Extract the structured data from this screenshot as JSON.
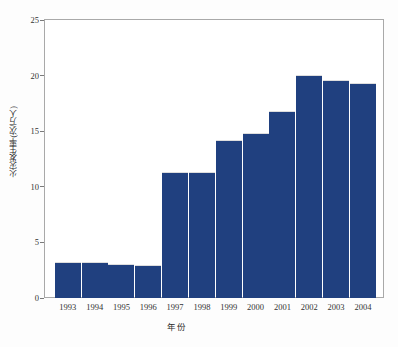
{
  "chart_data": {
    "type": "bar",
    "title": "",
    "subtitle": "",
    "xlabel": "年份",
    "ylabel": "火灾发生率(次/万人)",
    "categories": [
      "1993",
      "1994",
      "1995",
      "1996",
      "1997",
      "1998",
      "1999",
      "2000",
      "2001",
      "2002",
      "2003",
      "2004"
    ],
    "values": [
      3.2,
      3.25,
      3.1,
      3.0,
      11.3,
      11.3,
      14.25,
      14.8,
      16.8,
      20.05,
      19.6,
      19.3
    ],
    "series": [
      {
        "name": "火灾发生率",
        "values": [
          3.2,
          3.25,
          3.1,
          3.0,
          11.3,
          11.3,
          14.25,
          14.8,
          16.8,
          20.05,
          19.6,
          19.3
        ]
      }
    ],
    "ylim": [
      0,
      25
    ],
    "yticks": [
      0,
      5,
      10,
      15,
      20,
      25
    ],
    "ytick_labels": [
      "0",
      "5",
      "10",
      "15",
      "20",
      "25"
    ],
    "grid": false,
    "legend": null,
    "legend_position": "none",
    "bar_color": "#20407f",
    "frame_color": "#a9a9a9",
    "background": "#ffffff"
  }
}
